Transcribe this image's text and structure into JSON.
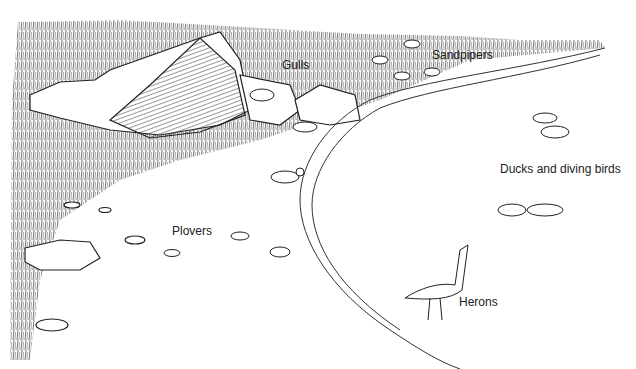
{
  "illustration": {
    "description": "Line drawing of a shoreline habitat with rocks, grass, a beach and water, showing bird groups",
    "labels": {
      "gulls": "Gulls",
      "sandpipers": "Sandpipers",
      "ducks": "Ducks and diving birds",
      "plovers": "Plovers",
      "herons": "Herons"
    },
    "colors": {
      "ink": "#222222",
      "paper": "#ffffff",
      "grass": "#555555"
    }
  }
}
